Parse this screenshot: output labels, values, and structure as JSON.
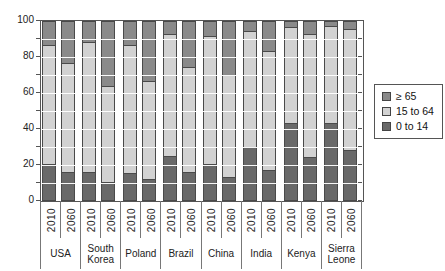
{
  "figure": {
    "background": "#ffffff"
  },
  "y_axis": {
    "tick_values": [
      0,
      10,
      20,
      30,
      40,
      50,
      60,
      70,
      80,
      90,
      100
    ],
    "label_values": [
      0,
      20,
      40,
      60,
      80,
      100
    ]
  },
  "legend": {
    "items": [
      {
        "label": "≥ 65",
        "color": "#8a8a8a"
      },
      {
        "label": "15 to 64",
        "color": "#d2d2d2"
      },
      {
        "label": "0 to 14",
        "color": "#696969"
      }
    ]
  },
  "chart_data": {
    "type": "bar",
    "stacked": true,
    "percent": true,
    "title": "",
    "xlabel": "",
    "ylabel": "",
    "ylim": [
      0,
      100
    ],
    "grid": "horizontal-white-over-bars",
    "legend_position": "right",
    "series_order_bottom_to_top": [
      "0 to 14",
      "15 to 64",
      "≥ 65"
    ],
    "colors": {
      "0 to 14": "#696969",
      "15 to 64": "#d2d2d2",
      "≥ 65": "#8a8a8a"
    },
    "bar_outline": "#4a4a4a",
    "groups": [
      {
        "country": "USA",
        "bars": [
          {
            "year": "2010",
            "values": [
              20,
              67,
              13
            ]
          },
          {
            "year": "2060",
            "values": [
              16,
              61,
              23
            ]
          }
        ]
      },
      {
        "country": "South Korea",
        "bars": [
          {
            "year": "2010",
            "values": [
              16,
              73,
              11
            ]
          },
          {
            "year": "2060",
            "values": [
              10,
              54,
              36
            ]
          }
        ]
      },
      {
        "country": "Poland",
        "bars": [
          {
            "year": "2010",
            "values": [
              15,
              72,
              13
            ]
          },
          {
            "year": "2060",
            "values": [
              12,
              55,
              33
            ]
          }
        ]
      },
      {
        "country": "Brazil",
        "bars": [
          {
            "year": "2010",
            "values": [
              25,
              68,
              7
            ]
          },
          {
            "year": "2060",
            "values": [
              16,
              59,
              25
            ]
          }
        ]
      },
      {
        "country": "China",
        "bars": [
          {
            "year": "2010",
            "values": [
              20,
              72,
              8
            ]
          },
          {
            "year": "2060",
            "values": [
              13,
              57,
              30
            ]
          }
        ]
      },
      {
        "country": "India",
        "bars": [
          {
            "year": "2010",
            "values": [
              30,
              65,
              5
            ]
          },
          {
            "year": "2060",
            "values": [
              17,
              67,
              16
            ]
          }
        ]
      },
      {
        "country": "Kenya",
        "bars": [
          {
            "year": "2010",
            "values": [
              43,
              54,
              3
            ]
          },
          {
            "year": "2060",
            "values": [
              24,
              69,
              7
            ]
          }
        ]
      },
      {
        "country": "Sierra Leone",
        "bars": [
          {
            "year": "2010",
            "values": [
              43,
              55,
              2
            ]
          },
          {
            "year": "2060",
            "values": [
              28,
              68,
              4
            ]
          }
        ]
      }
    ]
  }
}
